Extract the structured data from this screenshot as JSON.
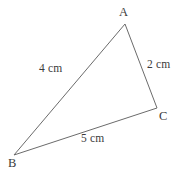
{
  "figure": {
    "background_color": "#ffffff",
    "stroke_color": "#6b6b6b",
    "text_color": "#3b3b3b",
    "vertices": {
      "a": {
        "label": "A",
        "x": 125,
        "y": 24
      },
      "b": {
        "label": "B",
        "x": 14,
        "y": 155
      },
      "c": {
        "label": "C",
        "x": 157,
        "y": 108
      }
    },
    "sides": {
      "ab": {
        "label": "4 cm",
        "from": "B",
        "to": "A"
      },
      "ac": {
        "label": "2 cm",
        "from": "A",
        "to": "C"
      },
      "bc": {
        "label": "5 cm",
        "from": "B",
        "to": "C"
      }
    }
  },
  "chart_data": {
    "type": "diagram",
    "title": "",
    "shape": "triangle",
    "points": [
      {
        "name": "A",
        "x": 125,
        "y": 24
      },
      {
        "name": "B",
        "x": 14,
        "y": 155
      },
      {
        "name": "C",
        "x": 157,
        "y": 108
      }
    ],
    "edges": [
      {
        "from": "A",
        "to": "B",
        "length_label": "4 cm",
        "length": 4,
        "unit": "cm"
      },
      {
        "from": "A",
        "to": "C",
        "length_label": "2 cm",
        "length": 2,
        "unit": "cm"
      },
      {
        "from": "B",
        "to": "C",
        "length_label": "5 cm",
        "length": 5,
        "unit": "cm"
      }
    ],
    "xlabel": "",
    "ylabel": "",
    "grid": false,
    "legend": false
  }
}
